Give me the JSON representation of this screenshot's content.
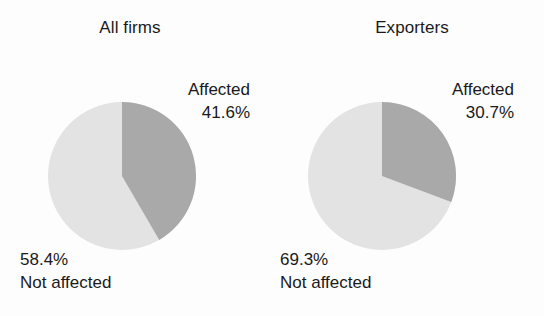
{
  "figure": {
    "background_color": "#fdfdfd",
    "text_color": "#1a1a1a"
  },
  "colors": {
    "affected_slice": "#a9a9a9",
    "not_affected_slice": "#e3e3e3"
  },
  "panels": [
    {
      "id": "all-firms",
      "title": "All firms",
      "affected_label": "Affected",
      "affected_value_label": "41.6%",
      "not_affected_value_label": "58.4%",
      "not_affected_label": "Not affected"
    },
    {
      "id": "exporters",
      "title": "Exporters",
      "affected_label": "Affected",
      "affected_value_label": "30.7%",
      "not_affected_value_label": "69.3%",
      "not_affected_label": "Not affected"
    }
  ],
  "chart_data": [
    {
      "type": "pie",
      "title": "All firms",
      "labels": [
        "Affected",
        "Not affected"
      ],
      "values": [
        41.6,
        58.4
      ],
      "value_labels": [
        "41.6%",
        "58.4%"
      ],
      "colors": [
        "#a9a9a9",
        "#e3e3e3"
      ],
      "start_angle_deg": 0,
      "direction": "clockwise",
      "legend": "none",
      "annotations": [
        "Affected 41.6%",
        "58.4% Not affected"
      ]
    },
    {
      "type": "pie",
      "title": "Exporters",
      "labels": [
        "Affected",
        "Not affected"
      ],
      "values": [
        30.7,
        69.3
      ],
      "value_labels": [
        "30.7%",
        "69.3%"
      ],
      "colors": [
        "#a9a9a9",
        "#e3e3e3"
      ],
      "start_angle_deg": 0,
      "direction": "clockwise",
      "legend": "none",
      "annotations": [
        "Affected 30.7%",
        "69.3% Not affected"
      ]
    }
  ]
}
